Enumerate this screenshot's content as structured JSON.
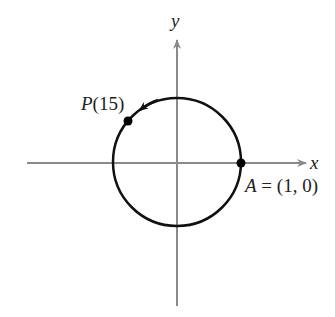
{
  "diagram": {
    "type": "unit-circle",
    "axes": {
      "x_label": "x",
      "y_label": "y",
      "color": "#8a8a8a"
    },
    "circle": {
      "color": "#111111",
      "direction": "counterclockwise"
    },
    "points": [
      {
        "id": "A",
        "label_name": "A",
        "label_rest": " = (1, 0)",
        "coords": [
          1,
          0
        ]
      },
      {
        "id": "P",
        "label_name": "P",
        "label_rest": "(15)",
        "t": 15
      }
    ]
  }
}
